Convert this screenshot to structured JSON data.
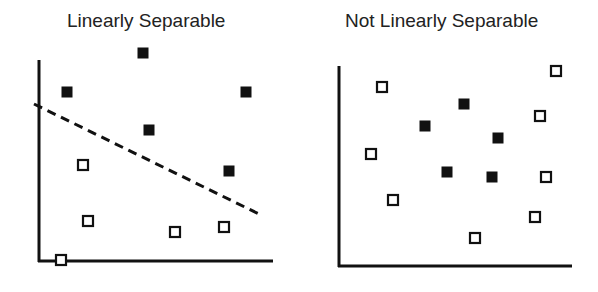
{
  "panels": [
    {
      "title": "Linearly Separable",
      "axes": {
        "origin": [
          39,
          261
        ],
        "y_top": 60,
        "x_right": 273
      },
      "boundary": {
        "style": "dashed",
        "from": [
          34,
          104
        ],
        "to": [
          259,
          214
        ]
      },
      "filled": [
        [
          143,
          53
        ],
        [
          67,
          92
        ],
        [
          246,
          92
        ],
        [
          149,
          130
        ],
        [
          229,
          171
        ]
      ],
      "open": [
        [
          83,
          165
        ],
        [
          88,
          221
        ],
        [
          175,
          232
        ],
        [
          224,
          227
        ],
        [
          61,
          260
        ]
      ]
    },
    {
      "title": "Not Linearly Separable",
      "axes": {
        "origin": [
          339,
          266
        ],
        "y_top": 66,
        "x_right": 572
      },
      "filled": [
        [
          464,
          104
        ],
        [
          425,
          126
        ],
        [
          498,
          138
        ],
        [
          447,
          172
        ],
        [
          492,
          177
        ]
      ],
      "open": [
        [
          556,
          71
        ],
        [
          382,
          87
        ],
        [
          540,
          116
        ],
        [
          371,
          154
        ],
        [
          546,
          177
        ],
        [
          393,
          200
        ],
        [
          535,
          217
        ],
        [
          475,
          238
        ]
      ]
    }
  ],
  "legend_semantics": {
    "filled": "class A (filled square)",
    "open": "class B (open square)"
  }
}
